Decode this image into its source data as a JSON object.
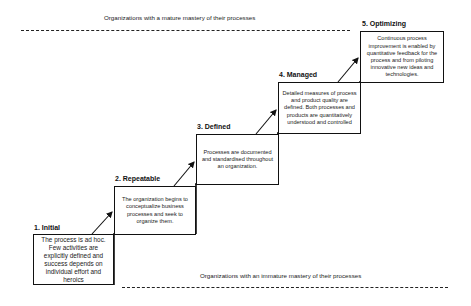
{
  "diagram": {
    "top_band": {
      "label": "Organizations with a mature mastery of their processes"
    },
    "bottom_band": {
      "label": "Organizations with an immature mastery of their processes"
    },
    "stages": [
      {
        "number": 1,
        "title": "1. Initial",
        "description": "The process is ad hoc. Few activities are explicitly defined and success depends on individual effort and heroics"
      },
      {
        "number": 2,
        "title": "2. Repeatable",
        "description": "The organization begins to conceptualize business processes and seek to organize them."
      },
      {
        "number": 3,
        "title": "3. Defined",
        "description": "Processes are documented and standardised throughout an organization."
      },
      {
        "number": 4,
        "title": "4. Managed",
        "description": "Detailed measures of process and product quality are defined. Both processes and products are quantitatively understood and controlled"
      },
      {
        "number": 5,
        "title": "5. Optimizing",
        "description": "Continuous process improvement is enabled by quantitative feedback for the process and from piloting innovative new ideas and technologies."
      }
    ],
    "colors": {
      "stroke": "#111111",
      "text": "#222222",
      "background": "#ffffff"
    }
  }
}
